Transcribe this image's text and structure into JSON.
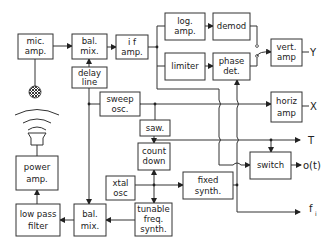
{
  "blocks": {
    "mic_amp": [
      "mic.",
      "amp."
    ],
    "bal_mix_top": [
      "bal.",
      "mix."
    ],
    "if_amp": [
      "i f",
      "amp."
    ],
    "delay_line": [
      "delay",
      "line"
    ],
    "log_amp": [
      "log.",
      "amp."
    ],
    "demod": [
      "demod"
    ],
    "limiter": [
      "limiter"
    ],
    "phase_det": [
      "phase",
      "det."
    ],
    "vert_amp": [
      "vert.",
      "amp"
    ],
    "sweep_osc": [
      "sweep",
      "osc."
    ],
    "horiz_amp": [
      "horiz",
      "amp"
    ],
    "saw": [
      "saw."
    ],
    "count_down": [
      "count",
      "down"
    ],
    "xtal_osc": [
      "xtal",
      "osc"
    ],
    "fixed_synth": [
      "fixed",
      "synth."
    ],
    "tunable_freq_synth": [
      "tunable",
      "freq.",
      "synth."
    ],
    "switch": [
      "switch"
    ],
    "power_amp": [
      "power",
      "amp."
    ],
    "low_pass_filter": [
      "low pass",
      "filter"
    ],
    "bal_mix_bottom": [
      "bal.",
      "mix."
    ]
  },
  "outputs": {
    "y": "Y",
    "x": "X",
    "t": "T",
    "o": "o(t)",
    "fi": "f",
    "fi_sub": "i"
  }
}
